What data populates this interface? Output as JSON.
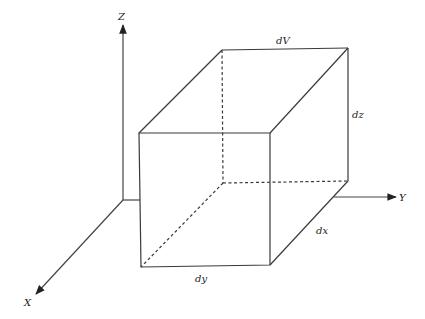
{
  "diagram": {
    "axes": {
      "x": {
        "label": "X"
      },
      "y": {
        "label": "Y"
      },
      "z": {
        "label": "Z"
      }
    },
    "labels": {
      "volume": "dV",
      "height": "dz",
      "depth": "dx",
      "width": "dy"
    },
    "colors": {
      "line": "#3a3a3a",
      "background": "#ffffff"
    }
  }
}
